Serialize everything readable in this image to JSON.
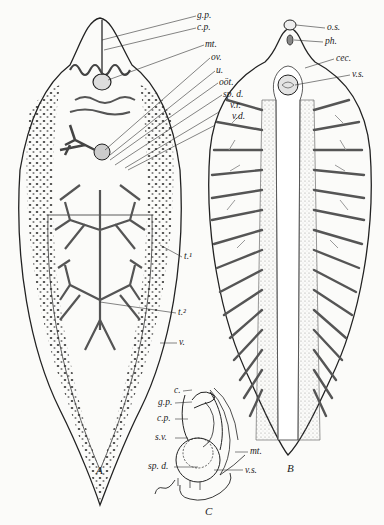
{
  "figure": {
    "panels": [
      {
        "id": "A",
        "caption": "A",
        "labels": [
          {
            "text": "g.p.",
            "x": 197,
            "y": 17
          },
          {
            "text": "c.p.",
            "x": 197,
            "y": 29
          },
          {
            "text": "mt.",
            "x": 205,
            "y": 45
          },
          {
            "text": "ov.",
            "x": 211,
            "y": 59
          },
          {
            "text": "u.",
            "x": 216,
            "y": 71
          },
          {
            "text": "oöt.",
            "x": 219,
            "y": 83
          },
          {
            "text": "sp. d.",
            "x": 223,
            "y": 95
          },
          {
            "text": "v.r.",
            "x": 230,
            "y": 106
          },
          {
            "text": "v.d.",
            "x": 232,
            "y": 117
          },
          {
            "text": "t.¹",
            "x": 183,
            "y": 257
          },
          {
            "text": "t.²",
            "x": 177,
            "y": 312
          },
          {
            "text": "v.",
            "x": 178,
            "y": 342
          }
        ]
      },
      {
        "id": "B",
        "caption": "B",
        "labels": [
          {
            "text": "o.s.",
            "x": 327,
            "y": 25
          },
          {
            "text": "ph.",
            "x": 325,
            "y": 39
          },
          {
            "text": "cec.",
            "x": 335,
            "y": 56
          },
          {
            "text": "v.s.",
            "x": 352,
            "y": 72
          }
        ]
      },
      {
        "id": "C",
        "caption": "C",
        "labels": [
          {
            "text": "c.",
            "x": 174,
            "y": 388
          },
          {
            "text": "g.p.",
            "x": 158,
            "y": 400
          },
          {
            "text": "c.p.",
            "x": 157,
            "y": 416
          },
          {
            "text": "s.v.",
            "x": 155,
            "y": 435
          },
          {
            "text": "mt.",
            "x": 250,
            "y": 449
          },
          {
            "text": "sp. d.",
            "x": 149,
            "y": 464
          },
          {
            "text": "v.s.",
            "x": 244,
            "y": 467
          }
        ]
      }
    ]
  }
}
